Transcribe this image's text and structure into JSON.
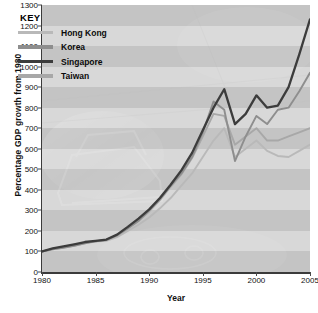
{
  "chart_data": {
    "type": "line",
    "title": "",
    "xlabel": "Year",
    "ylabel": "Percentage GDP growth from 1980",
    "xlim": [
      1980,
      2005
    ],
    "ylim": [
      0,
      1300
    ],
    "ytick_step": 100,
    "xtick_step": 5,
    "grid": "horizontal-bands",
    "legend_position": "top-left-inside",
    "legend_title": "KEY",
    "x": [
      1980,
      1981,
      1982,
      1983,
      1984,
      1985,
      1986,
      1987,
      1988,
      1989,
      1990,
      1991,
      1992,
      1993,
      1994,
      1995,
      1996,
      1997,
      1998,
      1999,
      2000,
      2001,
      2002,
      2003,
      2004,
      2005
    ],
    "series": [
      {
        "name": "Hong Kong",
        "color": "#b9b9b9",
        "values": [
          100,
          112,
          120,
          128,
          140,
          148,
          152,
          170,
          200,
          230,
          265,
          310,
          360,
          420,
          480,
          560,
          640,
          700,
          560,
          600,
          640,
          590,
          565,
          560,
          590,
          620
        ]
      },
      {
        "name": "Korea",
        "color": "#8e8e8e",
        "values": [
          100,
          110,
          118,
          128,
          140,
          150,
          155,
          178,
          212,
          248,
          300,
          355,
          420,
          480,
          560,
          680,
          830,
          790,
          540,
          660,
          760,
          720,
          790,
          800,
          880,
          970
        ]
      },
      {
        "name": "Singapore",
        "color": "#3c3c3c",
        "values": [
          100,
          115,
          125,
          135,
          146,
          152,
          158,
          182,
          220,
          260,
          305,
          360,
          425,
          495,
          580,
          690,
          800,
          890,
          720,
          770,
          860,
          800,
          810,
          900,
          1060,
          1230
        ]
      },
      {
        "name": "Taiwan",
        "color": "#a8a8a8",
        "values": [
          100,
          113,
          122,
          132,
          142,
          150,
          156,
          180,
          214,
          250,
          295,
          350,
          415,
          475,
          555,
          660,
          770,
          760,
          620,
          660,
          700,
          640,
          640,
          660,
          680,
          700
        ]
      }
    ]
  },
  "axis": {
    "y_ticks": [
      "0",
      "100",
      "200",
      "300",
      "400",
      "500",
      "600",
      "700",
      "800",
      "900",
      "1000",
      "1100",
      "1200",
      "1300"
    ],
    "x_ticks": [
      "1980",
      "1985",
      "1990",
      "1995",
      "2000",
      "2005"
    ],
    "y_title": "Percentage GDP growth from 1980",
    "x_title": "Year"
  },
  "legend": {
    "title": "KEY",
    "items": [
      {
        "label": "Hong Kong",
        "color": "#b9b9b9"
      },
      {
        "label": "Korea",
        "color": "#8e8e8e"
      },
      {
        "label": "Singapore",
        "color": "#3c3c3c"
      },
      {
        "label": "Taiwan",
        "color": "#a8a8a8"
      }
    ]
  },
  "colors": {
    "plot_background": "#cfcfcf",
    "band_light": "#d8d8d8",
    "band_dark": "#c4c4c4",
    "axis": "#3b3b3b",
    "text": "#111111"
  }
}
